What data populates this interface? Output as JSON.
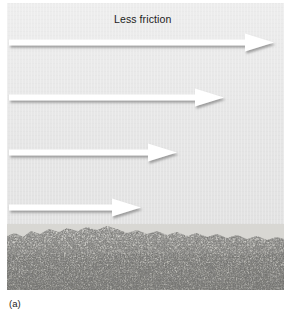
{
  "figure": {
    "caption": "(a)",
    "labels": {
      "top": "Less friction",
      "bottom": "More friction"
    },
    "colors": {
      "panel_background": "#e8e8e8",
      "arrow_fill": "#ffffff",
      "arrow_shadow": "#9e9e9e",
      "text": "#1c1c1c",
      "surface_light": "#d8d7d3",
      "surface_dark": "#2b2b2b"
    },
    "arrows": [
      {
        "name": "arrow-1",
        "top": 33,
        "length": 265,
        "label": "Less friction"
      },
      {
        "name": "arrow-2",
        "top": 88,
        "length": 215,
        "label": ""
      },
      {
        "name": "arrow-3",
        "top": 143,
        "length": 168,
        "label": ""
      },
      {
        "name": "arrow-4",
        "top": 198,
        "length": 132,
        "label": "More friction"
      }
    ],
    "surface": {
      "name": "rough-surface",
      "description": "rough granular surface"
    }
  }
}
